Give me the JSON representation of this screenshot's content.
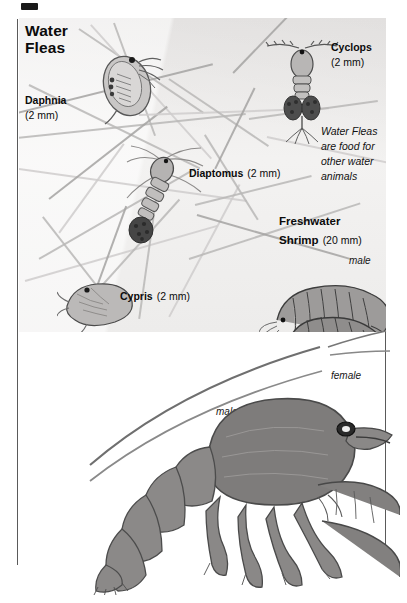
{
  "page": {
    "corner_mark": "black-registration-mark",
    "background_color": "#ffffff",
    "panel_color": "#eceaea"
  },
  "panel": {
    "heading_line1": "Water",
    "heading_line2": "Fleas",
    "note": "Water Fleas are food for other water animals",
    "note_lines": [
      "Water Fleas",
      "are food for",
      "other water",
      "animals"
    ],
    "specimens": [
      {
        "name": "Daphnia",
        "size": "(2 mm)",
        "icon": "daphnia-icon"
      },
      {
        "name": "Cyclops",
        "size": "(2 mm)",
        "icon": "cyclops-icon"
      },
      {
        "name": "Diaptomus",
        "size": "(2 mm)",
        "icon": "diaptomus-icon"
      },
      {
        "name": "Cypris",
        "size": "(2 mm)",
        "icon": "cypris-icon"
      }
    ],
    "shrimp": {
      "name_line1": "Freshwater",
      "name_line2": "Shrimp",
      "size": "(20 mm)",
      "male_label": "male",
      "female_label": "female"
    }
  },
  "lower": {
    "crayfish_label": "male",
    "icon": "crayfish-icon"
  }
}
